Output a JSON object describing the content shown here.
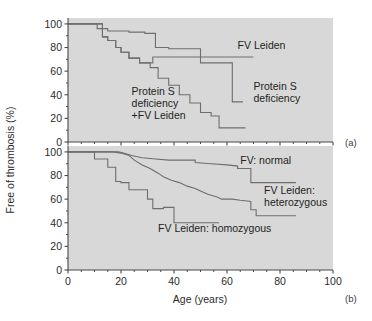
{
  "figure": {
    "background_color": "#ffffff",
    "plot_background_color": "#d8d8d8",
    "line_color": "#6e6e6e",
    "axis_color": "#4a4a4a",
    "text_color": "#231f20",
    "y_axis_label": "Free of thrombosis (%)",
    "x_axis_label": "Age (years)",
    "panel_a_tag": "(a)",
    "panel_b_tag": "(b)"
  },
  "axes": {
    "x_ticks": [
      0,
      20,
      40,
      60,
      80,
      100
    ],
    "x_tick_labels": [
      "0",
      "20",
      "40",
      "60",
      "80",
      "100"
    ],
    "x_minor_step": 5,
    "y_ticks": [
      0,
      20,
      40,
      60,
      80,
      100
    ],
    "y_tick_labels": [
      "0",
      "20",
      "40",
      "60",
      "80",
      "100"
    ],
    "xlim": [
      0,
      100
    ],
    "ylim": [
      0,
      105
    ],
    "grid": false
  },
  "chart_data": [
    {
      "type": "line",
      "panel": "a",
      "tag": "(a)",
      "title": "",
      "xlabel": "",
      "ylabel": "Free of thrombosis (%)",
      "xlim": [
        0,
        100
      ],
      "ylim": [
        0,
        105
      ],
      "step": "post",
      "legend_position": "inline-annotations",
      "series": [
        {
          "name": "FV Leiden",
          "label": "FV Leiden",
          "label_x": 64,
          "label_y": 79,
          "points": [
            [
              0,
              100
            ],
            [
              11,
              100
            ],
            [
              11,
              96
            ],
            [
              15,
              96
            ],
            [
              15,
              94
            ],
            [
              23,
              94
            ],
            [
              23,
              93
            ],
            [
              29,
              93
            ],
            [
              29,
              92
            ],
            [
              33,
              92
            ],
            [
              33,
              80
            ],
            [
              38,
              80
            ],
            [
              38,
              79
            ],
            [
              50,
              79
            ],
            [
              50,
              67
            ],
            [
              62,
              67
            ],
            [
              62,
              34
            ],
            [
              66,
              34
            ]
          ]
        },
        {
          "name": "Protein S deficiency",
          "label": "Protein S\ndeficiency",
          "label_line1": "Protein S",
          "label_line2": "deficiency",
          "label_x": 70,
          "label_y": 44,
          "points": [
            [
              0,
              100
            ],
            [
              13,
              100
            ],
            [
              13,
              89
            ],
            [
              15,
              89
            ],
            [
              15,
              86
            ],
            [
              18,
              86
            ],
            [
              18,
              80
            ],
            [
              20,
              80
            ],
            [
              20,
              76
            ],
            [
              23,
              76
            ],
            [
              23,
              71
            ],
            [
              27,
              71
            ],
            [
              27,
              67
            ],
            [
              32,
              67
            ],
            [
              32,
              72
            ],
            [
              38,
              72
            ],
            [
              38,
              72
            ],
            [
              62,
              72
            ],
            [
              62,
              72
            ],
            [
              70,
              72
            ]
          ]
        },
        {
          "name": "Protein S deficiency +FV Leiden",
          "label_line1": "Protein S",
          "label_line2": "deficiency",
          "label_line3": "+FV Leiden",
          "label_x": 24,
          "label_y": 40,
          "points": [
            [
              0,
              100
            ],
            [
              13,
              100
            ],
            [
              13,
              89
            ],
            [
              15,
              89
            ],
            [
              15,
              86
            ],
            [
              18,
              86
            ],
            [
              18,
              80
            ],
            [
              20,
              80
            ],
            [
              20,
              76
            ],
            [
              23,
              76
            ],
            [
              23,
              71
            ],
            [
              27,
              71
            ],
            [
              27,
              67
            ],
            [
              31,
              67
            ],
            [
              31,
              63
            ],
            [
              34,
              63
            ],
            [
              34,
              54
            ],
            [
              38,
              54
            ],
            [
              38,
              48
            ],
            [
              42,
              48
            ],
            [
              42,
              40
            ],
            [
              46,
              40
            ],
            [
              46,
              33
            ],
            [
              50,
              33
            ],
            [
              50,
              25
            ],
            [
              54,
              25
            ],
            [
              54,
              22
            ],
            [
              57,
              22
            ],
            [
              57,
              12
            ],
            [
              67,
              12
            ]
          ]
        }
      ]
    },
    {
      "type": "line",
      "panel": "b",
      "tag": "(b)",
      "title": "",
      "xlabel": "Age (years)",
      "ylabel": "Free of thrombosis (%)",
      "xlim": [
        0,
        100
      ],
      "ylim": [
        0,
        105
      ],
      "step": "post",
      "legend_position": "inline-annotations",
      "series": [
        {
          "name": "FV: normal",
          "label": "FV: normal",
          "label_x": 65,
          "label_y": 90,
          "points": [
            [
              0,
              100
            ],
            [
              19,
              100
            ],
            [
              21,
              99
            ],
            [
              24,
              97
            ],
            [
              28,
              95
            ],
            [
              33,
              94
            ],
            [
              38,
              93
            ],
            [
              43,
              93
            ],
            [
              48,
              93
            ],
            [
              48,
              91
            ],
            [
              54,
              90
            ],
            [
              60,
              89
            ],
            [
              64,
              88
            ],
            [
              64,
              86
            ],
            [
              69,
              86
            ],
            [
              69,
              74
            ],
            [
              86,
              74
            ]
          ]
        },
        {
          "name": "FV Leiden: heterozygous",
          "label_line1": "FV Leiden:",
          "label_line2": "heterozygous",
          "label_x": 74,
          "label_y": 64,
          "points": [
            [
              0,
              100
            ],
            [
              17,
              100
            ],
            [
              20,
              99
            ],
            [
              23,
              97
            ],
            [
              25,
              93
            ],
            [
              28,
              89
            ],
            [
              31,
              86
            ],
            [
              34,
              82
            ],
            [
              36,
              79
            ],
            [
              39,
              76
            ],
            [
              42,
              74
            ],
            [
              45,
              71
            ],
            [
              48,
              69
            ],
            [
              50,
              67
            ],
            [
              53,
              64
            ],
            [
              56,
              62
            ],
            [
              58,
              60
            ],
            [
              62,
              60
            ],
            [
              65,
              59
            ],
            [
              69,
              58
            ],
            [
              69,
              51
            ],
            [
              71,
              51
            ],
            [
              71,
              46
            ],
            [
              86,
              46
            ]
          ]
        },
        {
          "name": "FV Leiden: homozygous",
          "label": "FV Leiden: homozygous",
          "label_x": 34,
          "label_y": 32,
          "points": [
            [
              0,
              100
            ],
            [
              10,
              100
            ],
            [
              10,
              94
            ],
            [
              15,
              94
            ],
            [
              15,
              87
            ],
            [
              18,
              87
            ],
            [
              18,
              75
            ],
            [
              20,
              75
            ],
            [
              20,
              74
            ],
            [
              23,
              74
            ],
            [
              23,
              68
            ],
            [
              30,
              68
            ],
            [
              30,
              60
            ],
            [
              32,
              60
            ],
            [
              32,
              52
            ],
            [
              36,
              52
            ],
            [
              36,
              53
            ],
            [
              40,
              53
            ],
            [
              40,
              40
            ],
            [
              57,
              40
            ]
          ]
        }
      ]
    }
  ]
}
